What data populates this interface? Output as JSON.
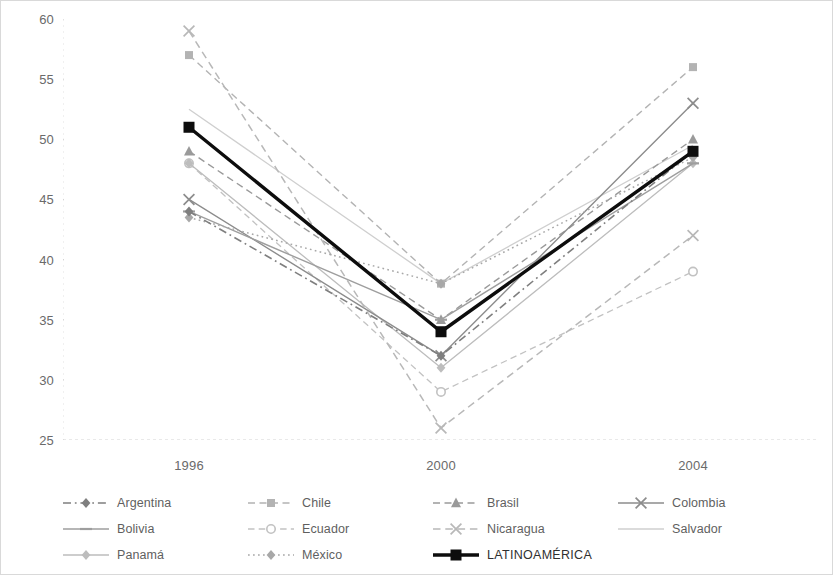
{
  "chart_data": {
    "type": "line",
    "title": "",
    "subtitle": "",
    "xlabel": "",
    "ylabel": "",
    "categories": [
      "1996",
      "2000",
      "2004"
    ],
    "x_tick_labels": [
      "1996",
      "2000",
      "2004"
    ],
    "y_tick_labels": [
      "25",
      "30",
      "35",
      "40",
      "45",
      "50",
      "55",
      "60"
    ],
    "y_ticks": [
      25,
      30,
      35,
      40,
      45,
      50,
      55,
      60
    ],
    "ylim": [
      25,
      60
    ],
    "grid": false,
    "legend_position": "bottom",
    "legend_columns": 4,
    "series": [
      {
        "name": "Argentina",
        "values": [
          44,
          32,
          49
        ],
        "color": "#7f7f7f",
        "line_style": "dash-dot",
        "marker": "diamond",
        "width": 1.6
      },
      {
        "name": "Chile",
        "values": [
          57,
          38,
          56
        ],
        "color": "#b3b3b3",
        "line_style": "dashed",
        "marker": "square",
        "width": 1.4
      },
      {
        "name": "Brasil",
        "values": [
          49,
          35,
          50
        ],
        "color": "#9a9a9a",
        "line_style": "dashed",
        "marker": "triangle",
        "width": 1.4
      },
      {
        "name": "Colombia",
        "values": [
          45,
          32,
          53
        ],
        "color": "#8c8c8c",
        "line_style": "solid",
        "marker": "cross",
        "width": 1.4
      },
      {
        "name": "Bolivia",
        "values": [
          44,
          35,
          48
        ],
        "color": "#9e9e9e",
        "line_style": "solid",
        "marker": "dash",
        "width": 1.4
      },
      {
        "name": "Ecuador",
        "values": [
          48,
          29,
          39
        ],
        "color": "#c2c2c2",
        "line_style": "dashed",
        "marker": "circle",
        "width": 1.3
      },
      {
        "name": "Nicaragua",
        "values": [
          59,
          26,
          42
        ],
        "color": "#b8b8b8",
        "line_style": "dashed",
        "marker": "cross",
        "width": 1.5
      },
      {
        "name": "Salvador",
        "values": [
          52.5,
          38,
          49.5
        ],
        "color": "#cfcfcf",
        "line_style": "solid",
        "marker": "none",
        "width": 1.3
      },
      {
        "name": "Panamá",
        "values": [
          48,
          31,
          48
        ],
        "color": "#bdbdbd",
        "line_style": "solid",
        "marker": "diamond",
        "width": 1.3
      },
      {
        "name": "México",
        "values": [
          43.5,
          38,
          48.5
        ],
        "color": "#a8a8a8",
        "line_style": "dotted",
        "marker": "diamond",
        "width": 1.5
      },
      {
        "name": "LATINOAMÉRICA",
        "values": [
          51,
          34,
          49
        ],
        "color": "#0d0d0d",
        "line_style": "solid",
        "marker": "square",
        "width": 3.4
      }
    ]
  },
  "legend": {
    "items": [
      {
        "label": "Argentina",
        "column": 0,
        "row": 0
      },
      {
        "label": "Chile",
        "column": 1,
        "row": 0
      },
      {
        "label": "Brasil",
        "column": 2,
        "row": 0
      },
      {
        "label": "Colombia",
        "column": 3,
        "row": 0
      },
      {
        "label": "Bolivia",
        "column": 0,
        "row": 1
      },
      {
        "label": "Ecuador",
        "column": 1,
        "row": 1
      },
      {
        "label": "Nicaragua",
        "column": 2,
        "row": 1
      },
      {
        "label": "Salvador",
        "column": 3,
        "row": 1
      },
      {
        "label": "Panamá",
        "column": 0,
        "row": 2
      },
      {
        "label": "México",
        "column": 1,
        "row": 2
      },
      {
        "label": "LATINOAMÉRICA",
        "column": 2,
        "row": 2
      }
    ]
  },
  "colors": {
    "figure_border": "#d9d9d9",
    "axis_line": "#d2d2d2",
    "tick_text": "#6a6a6a",
    "highlight_series": "#0d0d0d"
  }
}
